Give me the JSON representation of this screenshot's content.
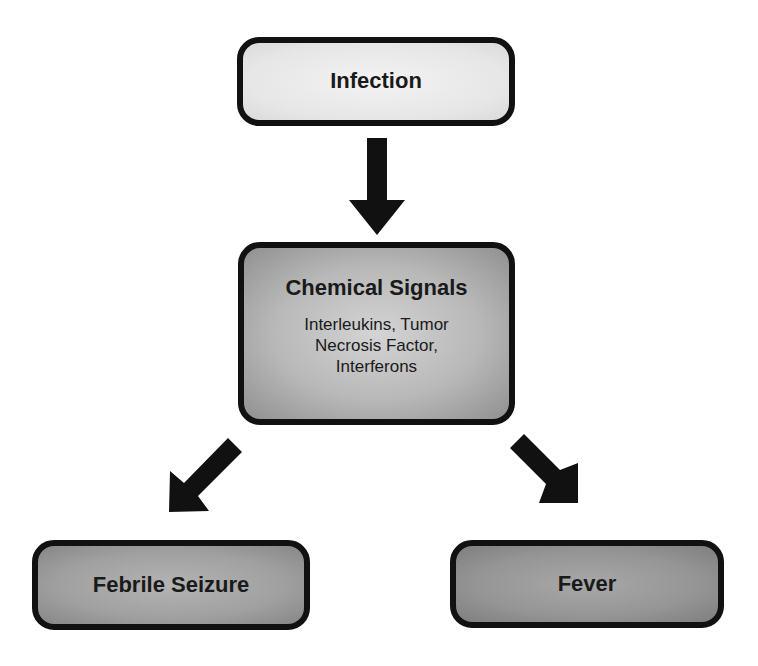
{
  "diagram": {
    "type": "flowchart",
    "nodes": {
      "infection": {
        "title": "Infection"
      },
      "chemical_signals": {
        "title": "Chemical Signals",
        "subtitle_lines": [
          "Interleukins, Tumor",
          "Necrosis Factor,",
          "Interferons"
        ]
      },
      "febrile_seizure": {
        "title": "Febrile Seizure"
      },
      "fever": {
        "title": "Fever"
      }
    },
    "edges": [
      {
        "from": "Infection",
        "to": "Chemical Signals",
        "direction": "down"
      },
      {
        "from": "Chemical Signals",
        "to": "Febrile Seizure",
        "direction": "down-left"
      },
      {
        "from": "Chemical Signals",
        "to": "Fever",
        "direction": "down-right"
      }
    ],
    "colors": {
      "border": "#111111",
      "arrow": "#111111",
      "text": "#1a1a1a",
      "infection_fill": "#e6e6e6",
      "chemical_fill": "#b8b8b8",
      "seizure_fill": "#a0a0a0",
      "fever_fill": "#959595"
    }
  }
}
